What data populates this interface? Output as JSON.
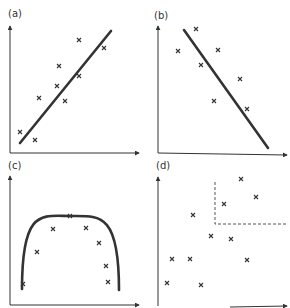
{
  "panels": [
    {
      "id": "a",
      "label": "(a)",
      "description": "positive linear correlation",
      "points": [
        [
          20,
          132
        ],
        [
          35,
          140
        ],
        [
          39,
          98
        ],
        [
          57,
          86
        ],
        [
          59,
          66
        ],
        [
          65,
          101
        ],
        [
          79,
          40
        ],
        [
          79,
          76
        ],
        [
          104,
          48
        ]
      ],
      "trend": {
        "type": "line",
        "from": [
          20,
          143
        ],
        "to": [
          111,
          31
        ]
      }
    },
    {
      "id": "b",
      "label": "(b)",
      "description": "negative linear correlation",
      "points": [
        [
          178,
          51
        ],
        [
          196,
          29
        ],
        [
          201,
          65
        ],
        [
          218,
          50
        ],
        [
          214,
          101
        ],
        [
          240,
          79
        ],
        [
          247,
          109
        ]
      ],
      "trend": {
        "type": "line",
        "from": [
          184,
          30
        ],
        "to": [
          268,
          148
        ]
      }
    },
    {
      "id": "c",
      "label": "(c)",
      "description": "curvilinear (inverted U) relationship",
      "points": [
        [
          23,
          284
        ],
        [
          37,
          252
        ],
        [
          53,
          229
        ],
        [
          70,
          216
        ],
        [
          86,
          228
        ],
        [
          99,
          243
        ],
        [
          106,
          266
        ],
        [
          108,
          282
        ]
      ],
      "trend": {
        "type": "curve",
        "from": [
          22,
          289
        ],
        "peak": [
          70,
          216
        ],
        "to": [
          119,
          290
        ]
      }
    },
    {
      "id": "d",
      "label": "(d)",
      "description": "no correlation with dashed highlight region",
      "points": [
        [
          241,
          179
        ],
        [
          256,
          197
        ],
        [
          224,
          204
        ],
        [
          193,
          215
        ],
        [
          211,
          236
        ],
        [
          231,
          239
        ],
        [
          172,
          259
        ],
        [
          190,
          259
        ],
        [
          247,
          260
        ],
        [
          167,
          283
        ],
        [
          201,
          285
        ]
      ],
      "dashed_region": {
        "x": 215,
        "y": 182,
        "right": 287,
        "bottom": 224
      }
    }
  ]
}
